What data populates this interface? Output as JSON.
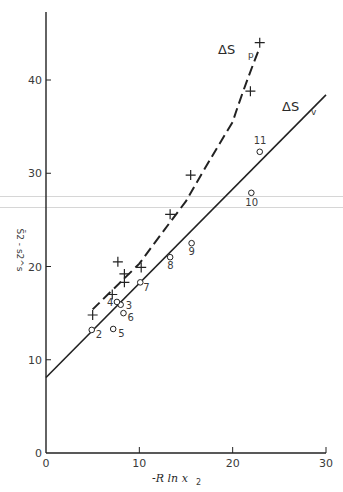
{
  "chart_data": {
    "type": "scatter",
    "title": "",
    "xlabel": "-R ln x2",
    "ylabel": "S̄2 - s2^s",
    "xlim": [
      0,
      30
    ],
    "ylim": [
      0,
      47
    ],
    "xticks": [
      0,
      10,
      20,
      30
    ],
    "yticks": [
      0,
      10,
      20,
      30,
      40
    ],
    "grid": false,
    "legend": "inline labels",
    "series": [
      {
        "name": "ΔS_v",
        "marker": "circle",
        "points": [
          {
            "label": "2",
            "x": 4.9,
            "y": 13.2
          },
          {
            "label": "3",
            "x": 8.0,
            "y": 15.9
          },
          {
            "label": "4",
            "x": 7.6,
            "y": 16.2
          },
          {
            "label": "5",
            "x": 7.2,
            "y": 13.3
          },
          {
            "label": "6",
            "x": 8.3,
            "y": 15.0
          },
          {
            "label": "7",
            "x": 10.1,
            "y": 18.3
          },
          {
            "label": "8",
            "x": 13.3,
            "y": 21.0
          },
          {
            "label": "9",
            "x": 15.6,
            "y": 22.5
          },
          {
            "label": "10",
            "x": 22.0,
            "y": 27.9
          },
          {
            "label": "11",
            "x": 22.9,
            "y": 32.3
          }
        ],
        "fit_line": {
          "style": "solid",
          "x": [
            0,
            30
          ],
          "y": [
            8.1,
            38.4
          ]
        }
      },
      {
        "name": "ΔS_p",
        "marker": "plus",
        "points": [
          {
            "x": 5.0,
            "y": 14.8
          },
          {
            "x": 7.1,
            "y": 17.0
          },
          {
            "x": 7.7,
            "y": 20.5
          },
          {
            "x": 8.4,
            "y": 19.2
          },
          {
            "x": 8.4,
            "y": 18.3
          },
          {
            "x": 10.2,
            "y": 19.9
          },
          {
            "x": 13.3,
            "y": 25.6
          },
          {
            "x": 15.5,
            "y": 29.8
          },
          {
            "x": 21.9,
            "y": 38.8
          },
          {
            "x": 22.9,
            "y": 44.0
          }
        ],
        "fit_curve": {
          "style": "dashed",
          "x": [
            5.0,
            10.0,
            15.0,
            20.0,
            22.9
          ],
          "y": [
            15.4,
            20.3,
            27.0,
            35.5,
            43.5
          ]
        }
      }
    ]
  },
  "labels": {
    "series_p": "ΔS",
    "series_p_sub": "p",
    "series_v": "ΔS",
    "series_v_sub": "v",
    "xlabel_main": "-R ln x",
    "xlabel_sub": "2"
  }
}
